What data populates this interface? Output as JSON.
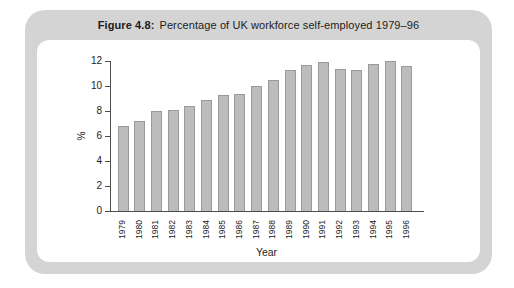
{
  "figure": {
    "label": "Figure 4.8:",
    "caption": "Percentage of UK workforce self-employed 1979–96"
  },
  "chart_data": {
    "type": "bar",
    "title": "Figure 4.8: Percentage of UK workforce self-employed 1979–96",
    "categories": [
      "1979",
      "1980",
      "1981",
      "1982",
      "1983",
      "1984",
      "1985",
      "1986",
      "1987",
      "1988",
      "1989",
      "1990",
      "1991",
      "1992",
      "1993",
      "1994",
      "1995",
      "1996"
    ],
    "values": [
      6.8,
      7.2,
      8.0,
      8.1,
      8.4,
      8.9,
      9.3,
      9.4,
      10.0,
      10.5,
      11.3,
      11.7,
      11.9,
      11.4,
      11.3,
      11.8,
      12.0,
      11.6
    ],
    "xlabel": "Year",
    "ylabel": "%",
    "ylim": [
      0,
      12
    ],
    "yticks": [
      0,
      2,
      4,
      6,
      8,
      10,
      12
    ],
    "grid": false,
    "legend": false,
    "bar_color": "#bcbcbc",
    "bar_border_color": "#9a9a9a"
  },
  "colors": {
    "card_background": "#d4d4d4",
    "panel_background": "#ffffff",
    "axis": "#4d4d4d",
    "text": "#1c1c1c"
  }
}
